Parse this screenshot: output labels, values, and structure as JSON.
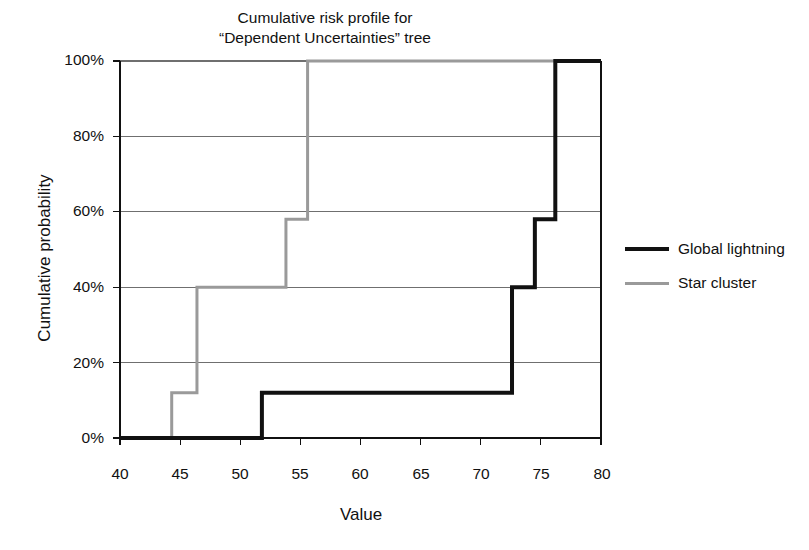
{
  "chart_data": {
    "type": "line",
    "subtype": "step",
    "title": "Cumulative risk profile for “Dependent Uncertainties” tree",
    "title_lines": [
      "Cumulative risk profile for",
      "“Dependent Uncertainties” tree"
    ],
    "xlabel": "Value",
    "ylabel": "Cumulative probability",
    "xlim": [
      40,
      80
    ],
    "ylim": [
      0,
      100
    ],
    "xticks": [
      40,
      45,
      50,
      55,
      60,
      65,
      70,
      75,
      80
    ],
    "xtick_labels": [
      "40",
      "45",
      "50",
      "55",
      "60",
      "65",
      "70",
      "75",
      "80"
    ],
    "yticks": [
      0,
      20,
      40,
      60,
      80,
      100
    ],
    "ytick_labels": [
      "0%",
      "20%",
      "40%",
      "60%",
      "80%",
      "100%"
    ],
    "grid": "horizontal",
    "legend_position": "right",
    "series": [
      {
        "name": "Global lightning",
        "color": "#111111",
        "width": 4,
        "steps": [
          {
            "x": 40.0,
            "y": 0
          },
          {
            "x": 51.8,
            "y": 12
          },
          {
            "x": 72.6,
            "y": 40
          },
          {
            "x": 74.5,
            "y": 58
          },
          {
            "x": 76.2,
            "y": 100
          },
          {
            "x": 80.0,
            "y": 100
          }
        ]
      },
      {
        "name": "Star cluster",
        "color": "#9a9a9a",
        "width": 3,
        "steps": [
          {
            "x": 40.0,
            "y": 0
          },
          {
            "x": 44.3,
            "y": 12
          },
          {
            "x": 46.4,
            "y": 40
          },
          {
            "x": 53.8,
            "y": 58
          },
          {
            "x": 55.6,
            "y": 100
          },
          {
            "x": 80.0,
            "y": 100
          }
        ]
      }
    ]
  },
  "legend": {
    "entries": [
      {
        "label": "Global lightning"
      },
      {
        "label": "Star cluster"
      }
    ]
  },
  "colors": {
    "series_black": "#111111",
    "series_gray": "#9a9a9a",
    "grid": "#6f6f6f",
    "axis": "#111111",
    "background": "#ffffff"
  }
}
